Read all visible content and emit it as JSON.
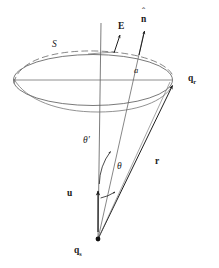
{
  "figure": {
    "background_color": "#ffffff",
    "stroke_color": "#2b2b2b",
    "label_color": "#1a1a1a"
  },
  "labels": {
    "surface": {
      "text": "S",
      "x": 52,
      "y": 44,
      "size": 9,
      "style": "italic"
    },
    "field": {
      "text": "E",
      "x": 118,
      "y": 27,
      "size": 9,
      "style": "bold"
    },
    "normal": {
      "text": "n",
      "x": 142,
      "y": 19,
      "size": 9,
      "style": "hat"
    },
    "radius": {
      "text": "a",
      "x": 135,
      "y": 71,
      "size": 8,
      "style": "italic"
    },
    "receiver": {
      "text": "q",
      "sub": "r",
      "x": 189,
      "y": 79,
      "size": 9,
      "style": "bold"
    },
    "source": {
      "text": "q",
      "sub": "s",
      "x": 76,
      "y": 249,
      "size": 9,
      "style": "bold"
    },
    "theta_prime": {
      "text": "θ′",
      "x": 84,
      "y": 141,
      "size": 9,
      "style": "italic"
    },
    "theta": {
      "text": "θ",
      "x": 118,
      "y": 166,
      "size": 9,
      "style": "italic"
    },
    "velocity": {
      "text": "u",
      "x": 68,
      "y": 193,
      "size": 9,
      "style": "bold"
    },
    "distance": {
      "text": "r",
      "x": 155,
      "y": 161,
      "size": 9,
      "style": "bold"
    }
  },
  "geometry": {
    "apex": {
      "x": 98,
      "y": 239
    },
    "axis_top": {
      "x": 101,
      "y": 23
    },
    "ellipse": {
      "cx": 93,
      "cy": 80,
      "rx": 80,
      "ry": 26
    },
    "receiver_point": {
      "x": 172,
      "y": 86
    },
    "normal_tip": {
      "x": 146,
      "y": 33
    },
    "field_tip": {
      "x": 122,
      "y": 38
    },
    "velocity_tip": {
      "x": 98,
      "y": 193
    },
    "arc_theta_prime": {
      "radius": 55
    },
    "arc_theta": {
      "radius": 90
    }
  }
}
